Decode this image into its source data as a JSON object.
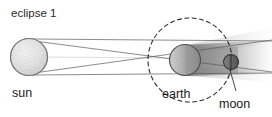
{
  "figure": {
    "title": "eclipse 1",
    "kind": "lunar-eclipse-diagram",
    "background_color": "#ffffff",
    "ink_color": "#1b1b1b"
  },
  "labels": {
    "sun": "sun",
    "earth": "earth",
    "moon": "moon"
  },
  "bodies": {
    "sun": {
      "name": "sun",
      "cx": 29,
      "cy": 57,
      "r": 18.5,
      "fill": "#ededed",
      "stroke": "#6f6f6f"
    },
    "earth": {
      "name": "earth",
      "cx": 185,
      "cy": 60,
      "r": 15.5,
      "fill": "#c9c9c9",
      "stroke": "#5e5e5e",
      "terminator": "vertical"
    },
    "moon": {
      "name": "moon",
      "cx": 231,
      "cy": 62,
      "r": 7.5,
      "fill": "#6a6a6a",
      "stroke": "#303030",
      "terminator": "vertical"
    }
  },
  "orbit": {
    "name": "moon-orbit",
    "cx": 190,
    "cy": 60,
    "r": 42,
    "style": "dashed",
    "stroke": "#262626"
  },
  "shadow": {
    "name": "earth-umbra-cone",
    "fill": "#9a9a9a",
    "direction": "right",
    "description": "shaded cone of earth shadow extending away from sun"
  },
  "rays": {
    "name": "sun-tangent-rays",
    "count": 4,
    "stroke": "#555555",
    "description": "tangent light rays from sun edges crossing past earth"
  }
}
